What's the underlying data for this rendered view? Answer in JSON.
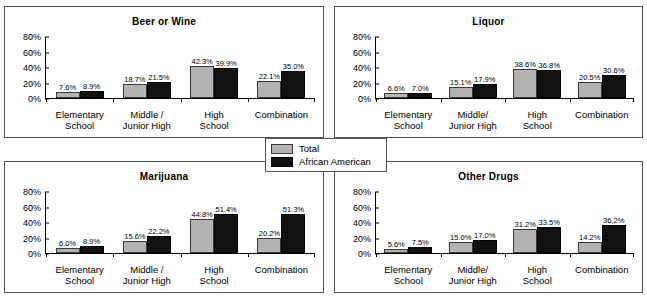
{
  "legend": {
    "entries": [
      {
        "label": "Total",
        "color": "#b3b3b3",
        "swatch": "total-swatch"
      },
      {
        "label": "African American",
        "color": "#111111",
        "swatch": "african-american-swatch"
      }
    ]
  },
  "axis": {
    "ticks": [
      "80%",
      "60%",
      "40%",
      "20%",
      "0%"
    ],
    "values": [
      80,
      60,
      40,
      20,
      0
    ],
    "max": 80
  },
  "panels": [
    {
      "id": "beer-or-wine",
      "title": "Beer or Wine",
      "categories": [
        "Elementary\nSchool",
        "Middle /\nJunior High",
        "High\nSchool",
        "Combination"
      ],
      "cat_lines": [
        [
          "Elementary",
          "School"
        ],
        [
          "Middle /",
          "Junior High"
        ],
        [
          "High",
          "School"
        ],
        [
          "Combination",
          ""
        ]
      ],
      "total": [
        7.6,
        18.7,
        42.3,
        22.1
      ],
      "african_american": [
        8.9,
        21.5,
        39.9,
        35.0
      ],
      "total_labels": [
        "7.6%",
        "18.7%",
        "42.3%",
        "22.1%"
      ],
      "african_american_labels": [
        "8.9%",
        "21.5%",
        "39.9%",
        "35.0%"
      ]
    },
    {
      "id": "liquor",
      "title": "Liquor",
      "categories": [
        "Elementary\nSchool",
        "Middle/\nJunior High",
        "High\nSchool",
        "Combination"
      ],
      "cat_lines": [
        [
          "Elementary",
          "School"
        ],
        [
          "Middle/",
          "Junior High"
        ],
        [
          "High",
          "School"
        ],
        [
          "Combination",
          ""
        ]
      ],
      "total": [
        6.6,
        15.1,
        38.6,
        20.5
      ],
      "african_american": [
        7.0,
        17.9,
        36.8,
        30.6
      ],
      "total_labels": [
        "6.6%",
        "15.1%",
        "38.6%",
        "20.5%"
      ],
      "african_american_labels": [
        "7.0%",
        "17.9%",
        "36.8%",
        "30.6%"
      ]
    },
    {
      "id": "marijuana",
      "title": "Marijuana",
      "categories": [
        "Elementary\nSchool",
        "Middle /\nJunior High",
        "High\nSchool",
        "Combination"
      ],
      "cat_lines": [
        [
          "Elementary",
          "School"
        ],
        [
          "Middle /",
          "Junior High"
        ],
        [
          "High",
          "School"
        ],
        [
          "Combination",
          ""
        ]
      ],
      "total": [
        6.0,
        15.6,
        44.8,
        20.2
      ],
      "african_american": [
        8.9,
        22.2,
        51.4,
        51.3
      ],
      "total_labels": [
        "6.0%",
        "15.6%",
        "44.8%",
        "20.2%"
      ],
      "african_american_labels": [
        "8.9%",
        "22.2%",
        "51.4%",
        "51.3%"
      ]
    },
    {
      "id": "other-drugs",
      "title": "Other Drugs",
      "categories": [
        "Elementary\nSchool",
        "Middle/\nJunior High",
        "High\nSchool",
        "Combination"
      ],
      "cat_lines": [
        [
          "Elementary",
          "School"
        ],
        [
          "Middle/",
          "Junior High"
        ],
        [
          "High",
          "School"
        ],
        [
          "Combination",
          ""
        ]
      ],
      "total": [
        5.6,
        15.0,
        31.2,
        14.2
      ],
      "african_american": [
        7.5,
        17.0,
        33.5,
        36.2
      ],
      "total_labels": [
        "5.6%",
        "15.0%",
        "31.2%",
        "14.2%"
      ],
      "african_american_labels": [
        "7.5%",
        "17.0%",
        "33.5%",
        "36.2%"
      ]
    }
  ],
  "chart_data": [
    {
      "type": "bar",
      "title": "Beer or Wine",
      "categories": [
        "Elementary School",
        "Middle / Junior High",
        "High School",
        "Combination"
      ],
      "series": [
        {
          "name": "Total",
          "values": [
            7.6,
            18.7,
            42.3,
            22.1
          ]
        },
        {
          "name": "African American",
          "values": [
            8.9,
            21.5,
            39.9,
            35.0
          ]
        }
      ],
      "xlabel": "",
      "ylabel": "",
      "ylim": [
        0,
        80
      ],
      "ytick_labels": [
        "0%",
        "20%",
        "40%",
        "60%",
        "80%"
      ],
      "grid": false,
      "legend_position": "center-shared"
    },
    {
      "type": "bar",
      "title": "Liquor",
      "categories": [
        "Elementary School",
        "Middle/ Junior High",
        "High School",
        "Combination"
      ],
      "series": [
        {
          "name": "Total",
          "values": [
            6.6,
            15.1,
            38.6,
            20.5
          ]
        },
        {
          "name": "African American",
          "values": [
            7.0,
            17.9,
            36.8,
            30.6
          ]
        }
      ],
      "xlabel": "",
      "ylabel": "",
      "ylim": [
        0,
        80
      ],
      "ytick_labels": [
        "0%",
        "20%",
        "40%",
        "60%",
        "80%"
      ],
      "grid": false,
      "legend_position": "center-shared"
    },
    {
      "type": "bar",
      "title": "Marijuana",
      "categories": [
        "Elementary School",
        "Middle / Junior High",
        "High School",
        "Combination"
      ],
      "series": [
        {
          "name": "Total",
          "values": [
            6.0,
            15.6,
            44.8,
            20.2
          ]
        },
        {
          "name": "African American",
          "values": [
            8.9,
            22.2,
            51.4,
            51.3
          ]
        }
      ],
      "xlabel": "",
      "ylabel": "",
      "ylim": [
        0,
        80
      ],
      "ytick_labels": [
        "0%",
        "20%",
        "40%",
        "60%",
        "80%"
      ],
      "grid": false,
      "legend_position": "center-shared"
    },
    {
      "type": "bar",
      "title": "Other Drugs",
      "categories": [
        "Elementary School",
        "Middle/ Junior High",
        "High School",
        "Combination"
      ],
      "series": [
        {
          "name": "Total",
          "values": [
            5.6,
            15.0,
            31.2,
            14.2
          ]
        },
        {
          "name": "African American",
          "values": [
            7.5,
            17.0,
            33.5,
            36.2
          ]
        }
      ],
      "xlabel": "",
      "ylabel": "",
      "ylim": [
        0,
        80
      ],
      "ytick_labels": [
        "0%",
        "20%",
        "40%",
        "60%",
        "80%"
      ],
      "grid": false,
      "legend_position": "center-shared"
    }
  ]
}
